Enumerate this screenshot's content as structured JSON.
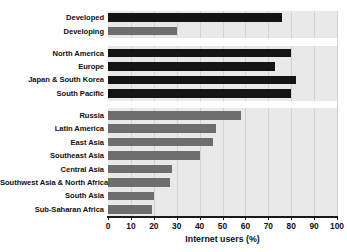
{
  "chart_data": {
    "type": "bar",
    "orientation": "horizontal",
    "title": "",
    "xlabel": "Internet users (%)",
    "ylabel": "",
    "xlim": [
      0,
      100
    ],
    "grid": true,
    "legend": false,
    "xticks": [
      0,
      10,
      20,
      30,
      40,
      50,
      60,
      70,
      80,
      90,
      100
    ],
    "xticklabels": [
      "0",
      "10",
      "20",
      "30",
      "40",
      "50",
      "60",
      "70",
      "80",
      "90",
      "100"
    ],
    "categories": [
      "Developed",
      "Developing",
      "North America",
      "Europe",
      "Japan & South Korea",
      "South Pacific",
      "Russia",
      "Latin America",
      "East Asia",
      "Southeast Asia",
      "Central Asia",
      "Southwest Asia & North Africa",
      "South Asia",
      "Sub-Saharan Africa"
    ],
    "values": [
      76,
      30,
      80,
      73,
      82,
      80,
      58,
      47,
      46,
      40,
      28,
      27,
      20,
      19
    ],
    "bar_colors": [
      "dark",
      "grey",
      "dark",
      "dark",
      "dark",
      "dark",
      "grey",
      "grey",
      "grey",
      "grey",
      "grey",
      "grey",
      "grey",
      "grey"
    ],
    "group_breaks_after": [
      1,
      5
    ],
    "colors": {
      "dark_bar": "#141414",
      "grey_bar": "#6e6e6e",
      "plot_background": "#e9e9e9",
      "gridline": "#d2d2d2",
      "axis": "#1a1a1a",
      "text": "#111111",
      "page_background": "#ffffff"
    }
  }
}
